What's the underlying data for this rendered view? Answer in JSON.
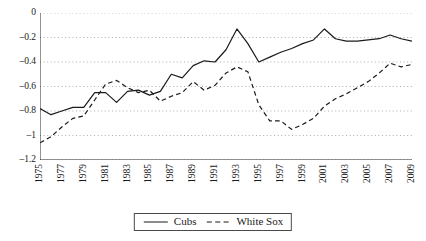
{
  "chart_data": {
    "type": "line",
    "title": "",
    "subtitle": "",
    "xlabel": "",
    "ylabel": "",
    "xlim": [
      1975,
      2009
    ],
    "ylim": [
      -1.2,
      0
    ],
    "grid": true,
    "grid_style": "dotted-horizontal",
    "legend_position": "bottom-center",
    "y_ticks": [
      0,
      -0.2,
      -0.4,
      -0.6,
      -0.8,
      -1,
      -1.2
    ],
    "y_tick_labels": [
      "0",
      "–0.2",
      "–0.4",
      "–0.6",
      "–0.8",
      "–1",
      "–1.2"
    ],
    "x_ticks": [
      1975,
      1977,
      1979,
      1981,
      1983,
      1985,
      1987,
      1989,
      1991,
      1993,
      1995,
      1997,
      1999,
      2001,
      2003,
      2005,
      2007,
      2009
    ],
    "x_tick_labels": [
      "1975",
      "1977",
      "1979",
      "1981",
      "1983",
      "1985",
      "1987",
      "1989",
      "1991",
      "1993",
      "1995",
      "1997",
      "1999",
      "2001",
      "2003",
      "2005",
      "2007",
      "2009"
    ],
    "x": [
      1975,
      1976,
      1977,
      1978,
      1979,
      1980,
      1981,
      1982,
      1983,
      1984,
      1985,
      1986,
      1987,
      1988,
      1989,
      1990,
      1991,
      1992,
      1993,
      1994,
      1995,
      1996,
      1997,
      1998,
      1999,
      2000,
      2001,
      2002,
      2003,
      2004,
      2005,
      2006,
      2007,
      2008,
      2009
    ],
    "series": [
      {
        "name": "Cubs",
        "line_style": "solid",
        "color": "#1a1a1a",
        "values": [
          -0.78,
          -0.83,
          -0.8,
          -0.77,
          -0.77,
          -0.65,
          -0.65,
          -0.73,
          -0.64,
          -0.63,
          -0.67,
          -0.64,
          -0.5,
          -0.53,
          -0.43,
          -0.39,
          -0.4,
          -0.3,
          -0.13,
          -0.25,
          -0.4,
          -0.36,
          -0.32,
          -0.29,
          -0.25,
          -0.22,
          -0.13,
          -0.21,
          -0.23,
          -0.23,
          -0.22,
          -0.21,
          -0.18,
          -0.21,
          -0.23
        ]
      },
      {
        "name": "White Sox",
        "line_style": "dashed",
        "color": "#1a1a1a",
        "values": [
          -1.06,
          -1.01,
          -0.93,
          -0.86,
          -0.84,
          -0.71,
          -0.58,
          -0.55,
          -0.61,
          -0.65,
          -0.63,
          -0.72,
          -0.68,
          -0.65,
          -0.56,
          -0.63,
          -0.59,
          -0.49,
          -0.44,
          -0.48,
          -0.75,
          -0.88,
          -0.88,
          -0.95,
          -0.91,
          -0.86,
          -0.76,
          -0.7,
          -0.66,
          -0.61,
          -0.56,
          -0.49,
          -0.41,
          -0.44,
          -0.42
        ]
      }
    ]
  },
  "legend": {
    "entries": [
      {
        "label": "Cubs",
        "style": "solid"
      },
      {
        "label": "White Sox",
        "style": "dashed"
      }
    ]
  }
}
